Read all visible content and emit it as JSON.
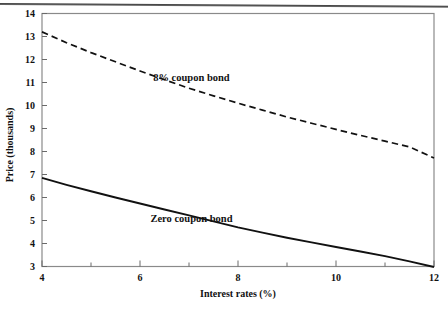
{
  "chart_data": {
    "type": "line",
    "title": "",
    "xlabel": "Interest rates (%)",
    "ylabel": "Price (thousands)",
    "xlim": [
      4,
      12
    ],
    "ylim": [
      3,
      14
    ],
    "xticks": [
      4,
      6,
      8,
      10,
      12
    ],
    "xticklabels": [
      "4",
      "6",
      "8",
      "10",
      "12"
    ],
    "xminorticks": [
      5,
      7,
      9,
      11
    ],
    "yticks": [
      3,
      4,
      5,
      6,
      7,
      8,
      9,
      10,
      11,
      12,
      13,
      14
    ],
    "yticklabels": [
      "3",
      "4",
      "5",
      "6",
      "7",
      "8",
      "9",
      "10",
      "11",
      "12",
      "13",
      "14"
    ],
    "grid": false,
    "legend_position": "inline-annotations",
    "series": [
      {
        "name": "8% coupon bond",
        "style": "dashed",
        "color": "#111111",
        "label_x": 7.05,
        "label_y": 11.05,
        "x": [
          4,
          4.5,
          5,
          5.5,
          6,
          6.5,
          7,
          7.5,
          8,
          8.5,
          9,
          9.5,
          10,
          10.5,
          11,
          11.5,
          12
        ],
        "values": [
          13.2,
          12.73,
          12.3,
          11.9,
          11.5,
          11.12,
          10.75,
          10.42,
          10.1,
          9.8,
          9.5,
          9.23,
          8.96,
          8.7,
          8.45,
          8.2,
          7.72
        ]
      },
      {
        "name": "Zero coupon bond",
        "style": "solid",
        "color": "#111111",
        "label_x": 7.05,
        "label_y": 4.95,
        "x": [
          4,
          4.5,
          5,
          5.5,
          6,
          6.5,
          7,
          7.5,
          8,
          8.5,
          9,
          9.5,
          10,
          10.5,
          11,
          11.5,
          12
        ],
        "values": [
          6.85,
          6.55,
          6.27,
          6.0,
          5.74,
          5.48,
          5.22,
          4.96,
          4.7,
          4.47,
          4.25,
          4.05,
          3.85,
          3.65,
          3.45,
          3.22,
          2.98
        ]
      }
    ]
  },
  "axes": {
    "x_label": "Interest rates (%)",
    "y_label": "Price (thousands)"
  },
  "annotations": {
    "series_1_label": "8% coupon bond",
    "series_2_label": "Zero coupon bond"
  },
  "colors": {
    "line": "#111111",
    "frame": "#8a8a8a",
    "text": "#111111",
    "background": "#ffffff",
    "top_rule": "#3a3a3a"
  }
}
